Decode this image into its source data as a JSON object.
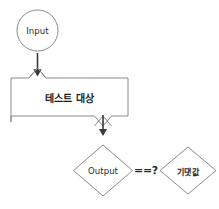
{
  "diagram": {
    "colors": {
      "stroke": "#8a8a8a",
      "arrow": "#3a3a3a",
      "text": "#2b2b2b",
      "background": "#ffffff"
    },
    "nodes": {
      "input": {
        "label": "Input",
        "shape": "circle"
      },
      "test_target": {
        "label": "테스트 대상",
        "shape": "rectangle"
      },
      "output": {
        "label": "Output",
        "shape": "diamond"
      },
      "expected": {
        "label": "기댓값",
        "shape": "diamond"
      }
    },
    "operator": {
      "label": "==?"
    },
    "edges": [
      {
        "from": "input",
        "to": "test_target",
        "label": ""
      },
      {
        "from": "test_target",
        "to": "output",
        "label": ""
      },
      {
        "from": "output",
        "to": "expected",
        "label": "==?"
      }
    ]
  }
}
